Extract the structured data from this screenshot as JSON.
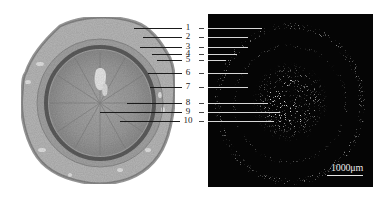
{
  "figure": {
    "left_panel": {
      "description": "stained transverse section, light-field micrograph"
    },
    "right_panel": {
      "description": "polarized / dark-field micrograph of same section"
    },
    "labels": [
      {
        "num": "1",
        "y": 28,
        "left_start": 134,
        "right_end": 262
      },
      {
        "num": "2",
        "y": 37,
        "left_start": 143,
        "right_end": 248
      },
      {
        "num": "3",
        "y": 47,
        "left_start": 140,
        "right_end": 248
      },
      {
        "num": "4",
        "y": 54,
        "left_start": 152,
        "right_end": 237
      },
      {
        "num": "5",
        "y": 60,
        "left_start": 157,
        "right_end": 226
      },
      {
        "num": "6",
        "y": 73,
        "left_start": 148,
        "right_end": 248
      },
      {
        "num": "7",
        "y": 87,
        "left_start": 150,
        "right_end": 248
      },
      {
        "num": "8",
        "y": 103,
        "left_start": 127,
        "right_end": 268
      },
      {
        "num": "9",
        "y": 112,
        "left_start": 100,
        "right_end": 280
      },
      {
        "num": "10",
        "y": 121,
        "left_start": 120,
        "right_end": 274
      }
    ],
    "scale_bar": {
      "label": "1000μm"
    }
  }
}
